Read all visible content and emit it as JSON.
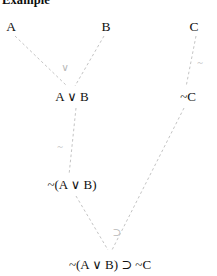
{
  "page": {
    "title": "Example",
    "width": 217,
    "height": 276,
    "background": "#ffffff",
    "edge_color": "#c4c4c4",
    "text_color": "#111111",
    "label_color": "#b9b9b9"
  },
  "tree": {
    "nodes": [
      {
        "id": "a",
        "label": "A",
        "x": 11,
        "y": 27,
        "kind": "leaf"
      },
      {
        "id": "b",
        "label": "B",
        "x": 106,
        "y": 27,
        "kind": "leaf"
      },
      {
        "id": "c",
        "label": "C",
        "x": 194,
        "y": 27,
        "kind": "leaf"
      },
      {
        "id": "aorb",
        "label": "A ∨ B",
        "x": 72,
        "y": 97,
        "kind": "derived"
      },
      {
        "id": "notc",
        "label": "~C",
        "x": 188,
        "y": 97,
        "kind": "derived"
      },
      {
        "id": "notaorb",
        "label": "~(A ∨ B)",
        "x": 72,
        "y": 185,
        "kind": "derived"
      },
      {
        "id": "conclusion",
        "label": "~(A ∨ B) ⊃ ~C",
        "x": 110,
        "y": 265,
        "kind": "conclusion"
      }
    ],
    "edges": [
      {
        "id": "a-aorb",
        "from": "a",
        "to": "aorb",
        "x1": 15,
        "y1": 36,
        "x2": 67,
        "y2": 86
      },
      {
        "id": "b-aorb",
        "from": "b",
        "to": "aorb",
        "x1": 104,
        "y1": 36,
        "x2": 75,
        "y2": 86
      },
      {
        "id": "c-notc",
        "from": "c",
        "to": "notc",
        "x1": 196,
        "y1": 36,
        "x2": 186,
        "y2": 87
      },
      {
        "id": "aorb-notaorb",
        "from": "aorb",
        "to": "notaorb",
        "x1": 76,
        "y1": 108,
        "x2": 69,
        "y2": 175
      },
      {
        "id": "notaorb-conclusion",
        "from": "notaorb",
        "to": "conclusion",
        "x1": 76,
        "y1": 196,
        "x2": 108,
        "y2": 250
      },
      {
        "id": "notc-conclusion",
        "from": "notc",
        "to": "conclusion",
        "x1": 184,
        "y1": 108,
        "x2": 112,
        "y2": 250
      }
    ],
    "connective_labels": [
      {
        "id": "or-label",
        "text": "∨",
        "x": 65,
        "y": 67,
        "for": "aorb"
      },
      {
        "id": "not-c-label",
        "text": "~",
        "x": 200,
        "y": 62,
        "for": "notc"
      },
      {
        "id": "not-aorb-label",
        "text": "~",
        "x": 60,
        "y": 146,
        "for": "notaorb"
      },
      {
        "id": "implies-label",
        "text": "⊃",
        "x": 117,
        "y": 232,
        "for": "conclusion"
      }
    ]
  }
}
